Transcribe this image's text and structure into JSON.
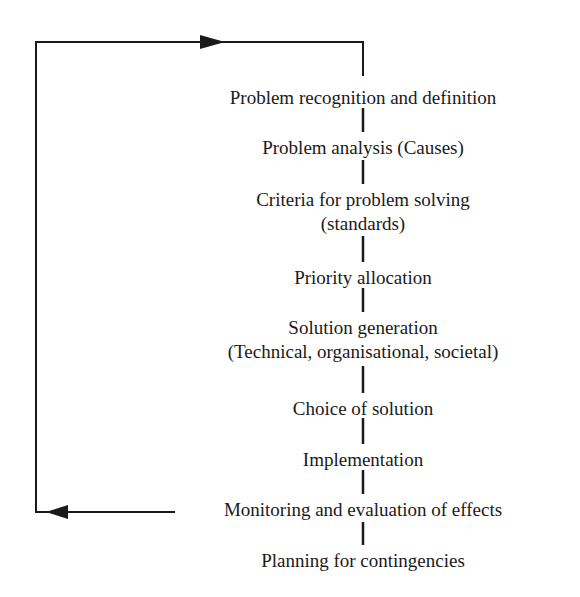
{
  "diagram": {
    "type": "flow-cycle",
    "steps": [
      {
        "lines": [
          "Problem recognition and definition"
        ],
        "top": 86
      },
      {
        "lines": [
          "Problem analysis (Causes)"
        ],
        "top": 136
      },
      {
        "lines": [
          "Criteria for problem solving",
          "(standards)"
        ],
        "top": 188
      },
      {
        "lines": [
          "Priority allocation"
        ],
        "top": 266
      },
      {
        "lines": [
          "Solution generation",
          "(Technical, organisational, societal)"
        ],
        "top": 316
      },
      {
        "lines": [
          "Choice of solution"
        ],
        "top": 397
      },
      {
        "lines": [
          "Implementation"
        ],
        "top": 448
      },
      {
        "lines": [
          "Monitoring and evaluation of effects"
        ],
        "top": 498
      },
      {
        "lines": [
          "Planning for contingencies"
        ],
        "top": 549
      }
    ],
    "feedback_loop": {
      "from": "Monitoring and evaluation of effects",
      "to": "Problem recognition and definition",
      "line_color": "#1a1a1a"
    }
  },
  "s0": "Problem recognition and definition",
  "s1": "Problem analysis (Causes)",
  "s2a": "Criteria for problem solving",
  "s2b": "(standards)",
  "s3": "Priority allocation",
  "s4a": "Solution generation",
  "s4b": "(Technical, organisational, societal)",
  "s5": "Choice of solution",
  "s6": "Implementation",
  "s7": "Monitoring and evaluation of effects",
  "s8": "Planning for contingencies"
}
